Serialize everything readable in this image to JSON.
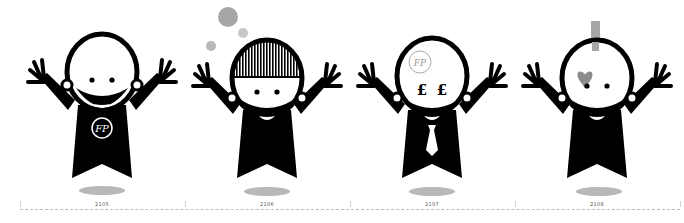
{
  "figures": [
    {
      "id": "figure-2105",
      "label": "2105",
      "accessory": "monogram on chest",
      "monogram": "FP",
      "x": 20
    },
    {
      "id": "figure-2106",
      "label": "2106",
      "accessory": "striped hair with floating bubbles",
      "x": 185
    },
    {
      "id": "figure-2107",
      "label": "2107",
      "accessory": "pound-sign eyes, necktie, monogram on forehead",
      "monogram": "FP",
      "eye_glyph": "£",
      "x": 350
    },
    {
      "id": "figure-2108",
      "label": "2108",
      "accessory": "grey mohawk bar and heart over eye",
      "x": 515
    }
  ],
  "timeline": {
    "style": "dashed",
    "ticks": 5
  },
  "colors": {
    "figure": "#000000",
    "background": "#ffffff",
    "shadow": "#b8b8b8",
    "accent_grey": "#a6a6a6",
    "heart": "#8c8c8c"
  }
}
